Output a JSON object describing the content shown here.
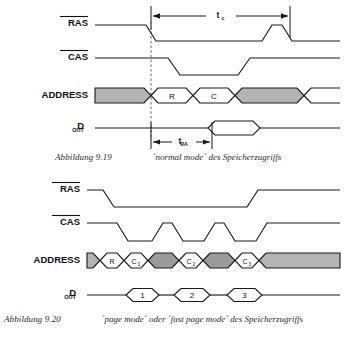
{
  "figures": [
    {
      "id": "fig-9-19",
      "caption_number": "Abbildung 9.19",
      "caption_text": "´normal mode´ des Speicherzugriffs",
      "signals": [
        {
          "name": "RAS",
          "label": "RAS",
          "overbar": true,
          "subscript": ""
        },
        {
          "name": "CAS",
          "label": "CAS",
          "overbar": true,
          "subscript": ""
        },
        {
          "name": "ADDRESS",
          "label": "ADDRESS",
          "overbar": false,
          "subscript": ""
        },
        {
          "name": "DOUT",
          "label": "D",
          "overbar": false,
          "subscript": "OUT"
        }
      ],
      "address_cells": [
        {
          "label": "",
          "sub": "",
          "fill": "gray"
        },
        {
          "label": "R",
          "sub": "",
          "fill": "white"
        },
        {
          "label": "C",
          "sub": "",
          "fill": "white"
        },
        {
          "label": "",
          "sub": "",
          "fill": "gray"
        }
      ],
      "data_cells": [
        {
          "label": "",
          "sub": ""
        }
      ],
      "timing_marks": [
        {
          "name": "tc",
          "label": "t",
          "sub": "c"
        },
        {
          "name": "tRA",
          "label": "t",
          "sub": "RA"
        }
      ]
    },
    {
      "id": "fig-9-20",
      "caption_number": "Abbildung 9.20",
      "caption_text": "´page mode´  oder  ´fast page mode´  des  Speicherzugriffs",
      "signals": [
        {
          "name": "RAS",
          "label": "RAS",
          "overbar": true,
          "subscript": ""
        },
        {
          "name": "CAS",
          "label": "CAS",
          "overbar": true,
          "subscript": ""
        },
        {
          "name": "ADDRESS",
          "label": "ADDRESS",
          "overbar": false,
          "subscript": ""
        },
        {
          "name": "DOUT",
          "label": "D",
          "overbar": false,
          "subscript": "OUT"
        }
      ],
      "address_cells": [
        {
          "label": "",
          "sub": "",
          "fill": "gray"
        },
        {
          "label": "R",
          "sub": "",
          "fill": "white"
        },
        {
          "label": "C",
          "sub": "1",
          "fill": "white"
        },
        {
          "label": "",
          "sub": "",
          "fill": "dark"
        },
        {
          "label": "C",
          "sub": "2",
          "fill": "white"
        },
        {
          "label": "",
          "sub": "",
          "fill": "dark"
        },
        {
          "label": "C",
          "sub": "3",
          "fill": "white"
        },
        {
          "label": "",
          "sub": "",
          "fill": "gray"
        }
      ],
      "data_cells": [
        {
          "label": "1",
          "sub": ""
        },
        {
          "label": "2",
          "sub": ""
        },
        {
          "label": "3",
          "sub": ""
        }
      ],
      "timing_marks": []
    }
  ],
  "colors": {
    "stroke": "#1a1a1a",
    "fill_gray": "#b4b4b4",
    "fill_dark": "#9a9a9a",
    "background": "#ffffff",
    "caption": "#2b2b2b"
  }
}
